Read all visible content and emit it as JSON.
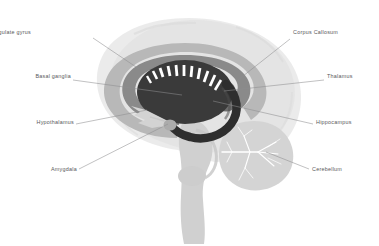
{
  "figure": {
    "kind": "medial-sagittal-brain-diagram",
    "background_color": "#ffffff",
    "label_text_color": "#58585a",
    "leader_line_color": "#8d8d90"
  },
  "palette": {
    "cerebrum_outline": "#ececec",
    "cerebrum_fill": "#e6e6e6",
    "cerebellum": "#d6d6d6",
    "brainstem": "#d2d2d2",
    "cingulate_gyrus": "#b9b9b9",
    "corpus_callosum": "#8a8a8a",
    "basal_ganglia": "#3b3b3b",
    "hippocampus": "#2f2f2f",
    "thalamus": "#6f6f6f",
    "hypothalamus": "#cfcfcf",
    "amygdala": "#b0b0b0",
    "striation_white": "#ffffff"
  },
  "labels": [
    {
      "id": "cingulate-gyrus",
      "text": "Cingulate gyrus",
      "side": "left",
      "x": 31,
      "y": 33,
      "leader": {
        "x1": 93,
        "y1": 38,
        "x2": 139,
        "y2": 69
      }
    },
    {
      "id": "corpus-callosum",
      "text": "Corpus Callosum",
      "side": "right",
      "x": 293,
      "y": 33,
      "leader": {
        "x1": 290,
        "y1": 39,
        "x2": 238,
        "y2": 80
      }
    },
    {
      "id": "basal-ganglia",
      "text": "Basal ganglia",
      "side": "left",
      "x": 20,
      "y": 77,
      "leader": {
        "x1": 73,
        "y1": 80,
        "x2": 182,
        "y2": 95
      }
    },
    {
      "id": "thalamus",
      "text": "Thalamus",
      "side": "right",
      "x": 327,
      "y": 77,
      "leader": {
        "x1": 324,
        "y1": 80,
        "x2": 224,
        "y2": 91
      }
    },
    {
      "id": "hypothalamus",
      "text": "Hypothalamus",
      "side": "left",
      "x": 19,
      "y": 123,
      "leader": {
        "x1": 76,
        "y1": 124,
        "x2": 147,
        "y2": 110
      }
    },
    {
      "id": "hippocampus",
      "text": "Hippocampus",
      "side": "right",
      "x": 316,
      "y": 123,
      "leader": {
        "x1": 313,
        "y1": 124,
        "x2": 213,
        "y2": 101
      }
    },
    {
      "id": "amygdala",
      "text": "Amygdala",
      "side": "left",
      "x": 32,
      "y": 170,
      "leader": {
        "x1": 79,
        "y1": 169,
        "x2": 168,
        "y2": 124
      }
    },
    {
      "id": "cerebellum",
      "text": "Cerebellum",
      "side": "right",
      "x": 312,
      "y": 170,
      "leader": {
        "x1": 309,
        "y1": 169,
        "x2": 266,
        "y2": 152
      }
    }
  ],
  "structures": [
    {
      "id": "cerebrum",
      "name": "cerebrum-silhouette"
    },
    {
      "id": "cerebellum",
      "name": "cerebellum"
    },
    {
      "id": "brainstem",
      "name": "brainstem"
    },
    {
      "id": "cingulate-gyrus",
      "name": "cingulate-gyrus-ring"
    },
    {
      "id": "corpus-callosum",
      "name": "corpus-callosum-ring"
    },
    {
      "id": "basal-ganglia",
      "name": "basal-ganglia-mass"
    },
    {
      "id": "thalamus",
      "name": "thalamus"
    },
    {
      "id": "hippocampus",
      "name": "hippocampus-hook"
    },
    {
      "id": "hypothalamus",
      "name": "hypothalamus"
    },
    {
      "id": "amygdala",
      "name": "amygdala"
    }
  ]
}
